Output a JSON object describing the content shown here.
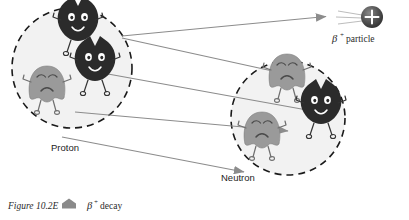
{
  "figure": {
    "caption_label": "Figure 10.2E",
    "caption_marker": "pentagon-marker",
    "caption_beta": "β",
    "caption_beta_sup": "+",
    "caption_text": "decay"
  },
  "labels": {
    "proton": "Proton",
    "neutron": "Neutron",
    "beta_particle_symbol": "β",
    "beta_particle_sup": "+",
    "beta_particle_text": "particle",
    "charge_sign": "+"
  },
  "colors": {
    "proton_fill": "#2b2b2b",
    "neutron_fill": "#9a9a9a",
    "nucleus_fill": "#f2f2f2",
    "nucleus_stroke": "#1a1a1a",
    "arrow": "#8c8c8c",
    "beta_sphere": "#4a4a4a",
    "text": "#1d1d1d"
  },
  "nuclei": [
    {
      "name": "parent-nucleus",
      "cx": 72,
      "cy": 68,
      "r": 60,
      "particles": [
        {
          "type": "proton",
          "x": 78,
          "y": 22
        },
        {
          "type": "proton",
          "x": 95,
          "y": 62
        },
        {
          "type": "neutron",
          "x": 47,
          "y": 82
        }
      ]
    },
    {
      "name": "daughter-nucleus",
      "cx": 288,
      "cy": 118,
      "r": 57,
      "particles": [
        {
          "type": "neutron",
          "x": 287,
          "y": 70
        },
        {
          "type": "proton",
          "x": 321,
          "y": 105
        },
        {
          "type": "neutron",
          "x": 262,
          "y": 128
        }
      ]
    }
  ],
  "arrows": [
    {
      "name": "proton-to-beta",
      "x1": 122,
      "y1": 36,
      "x2": 328,
      "y2": 16
    },
    {
      "name": "proton-to-neutron",
      "x1": 122,
      "y1": 38,
      "x2": 300,
      "y2": 77
    },
    {
      "name": "proton-to-daughter",
      "x1": 108,
      "y1": 74,
      "x2": 318,
      "y2": 112
    },
    {
      "name": "neutron-to-daughter",
      "x1": 75,
      "y1": 112,
      "x2": 288,
      "y2": 130
    },
    {
      "name": "neutron-label-arrow",
      "x1": 62,
      "y1": 137,
      "x2": 246,
      "y2": 172
    }
  ],
  "beta_particle": {
    "cx": 372,
    "cy": 17,
    "r": 11
  }
}
